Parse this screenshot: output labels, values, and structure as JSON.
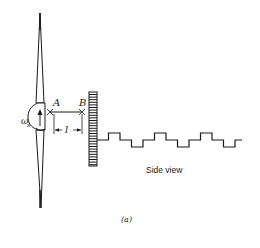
{
  "diagram": {
    "labels": {
      "point_a": "A",
      "point_b": "B",
      "distance": "l",
      "angular_speed": "ω",
      "angular_speed_subscript": "s",
      "side_view": "Side view",
      "caption": "(a)"
    },
    "waveform_levels": [
      "mid",
      "high",
      "mid",
      "low",
      "mid",
      "high",
      "mid",
      "low",
      "mid",
      "high",
      "mid",
      "low",
      "mid"
    ],
    "colors": {
      "ink": "#1a1a1a",
      "background": "#ffffff"
    }
  }
}
